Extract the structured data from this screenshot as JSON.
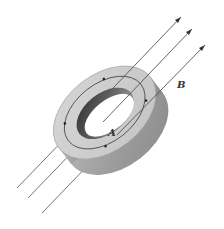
{
  "diagram": {
    "labels": {
      "field": "B",
      "area": "A"
    },
    "field_lines": [
      {
        "x1": 17,
        "y1": 188,
        "x2": 181,
        "y2": 17
      },
      {
        "x1": 28,
        "y1": 198,
        "x2": 192,
        "y2": 29
      },
      {
        "x1": 42,
        "y1": 213,
        "x2": 205,
        "y2": 45
      }
    ],
    "colors": {
      "field_line": "#555555",
      "ring_outer": "#a8a8a8",
      "ring_top": "#cfcfcf",
      "ring_inner_dark": "#3a3a3a",
      "path_line": "#444444"
    }
  }
}
